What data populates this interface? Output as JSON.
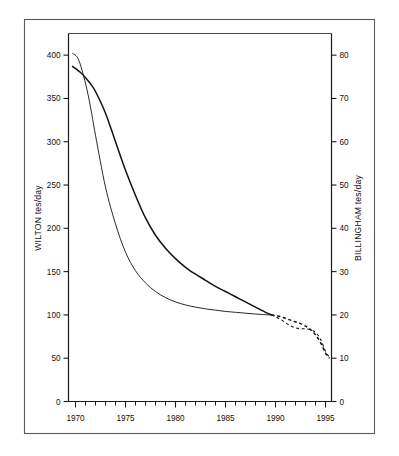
{
  "figure": {
    "background": "#ffffff",
    "ink": "#111111",
    "border_color": "#5a5a5a"
  },
  "chart_data": {
    "type": "line",
    "title": "",
    "xlabel": "",
    "ylabel": "WILTON  tes/day",
    "y2label": "BILLINGHAM  tes/day",
    "grid": false,
    "legend": "none",
    "xlim": [
      1969.3,
      1995.6
    ],
    "ylim": [
      0,
      425
    ],
    "y2lim": [
      0,
      85
    ],
    "x_ticks_major": [
      1970,
      1975,
      1980,
      1985,
      1990,
      1995
    ],
    "x_ticklabels": [
      "1970",
      "1975",
      "1980",
      "1985",
      "1990",
      "1995"
    ],
    "x_minor_step": 1,
    "y_ticks": [
      0,
      50,
      100,
      150,
      200,
      250,
      300,
      350,
      400
    ],
    "y_ticklabels": [
      "0",
      "50",
      "100",
      "150",
      "200",
      "250",
      "300",
      "350",
      "400"
    ],
    "y2_ticks": [
      0,
      10,
      20,
      30,
      40,
      50,
      60,
      70,
      80
    ],
    "y2_ticklabels": [
      "0",
      "10",
      "20",
      "30",
      "40",
      "50",
      "60",
      "70",
      "80"
    ],
    "series": [
      {
        "name": "WILTON",
        "axis": "left",
        "style": "solid",
        "linewidth": "bold",
        "x": [
          1969.7,
          1970.5,
          1971.0,
          1971.5,
          1972.0,
          1973.0,
          1974.0,
          1975.0,
          1976.0,
          1977.0,
          1978.0,
          1979.0,
          1980.0,
          1981.0,
          1982.0,
          1983.0,
          1984.0,
          1985.0,
          1986.0,
          1987.0,
          1988.0,
          1989.0,
          1989.6
        ],
        "values": [
          387,
          380,
          374,
          367,
          358,
          333,
          300,
          267,
          238,
          212,
          192,
          177,
          165,
          155,
          147,
          140,
          133,
          127,
          121,
          115,
          109,
          103,
          100
        ]
      },
      {
        "name": "WILTON-projected",
        "axis": "left",
        "style": "dashed",
        "linewidth": "bold",
        "x": [
          1989.6,
          1990.0,
          1990.5,
          1991.0,
          1991.5,
          1992.0,
          1992.5,
          1993.0,
          1993.5,
          1994.0,
          1994.5,
          1995.0,
          1995.4
        ],
        "values": [
          100,
          99,
          98,
          96,
          94,
          92,
          90,
          87,
          83,
          77,
          68,
          56,
          50
        ]
      },
      {
        "name": "BILLINGHAM",
        "axis": "right",
        "style": "solid",
        "linewidth": "thin",
        "x": [
          1969.7,
          1970.3,
          1971.0,
          1971.5,
          1972.0,
          1973.0,
          1974.0,
          1975.0,
          1976.0,
          1977.0,
          1978.0,
          1979.0,
          1980.0,
          1981.0,
          1982.0,
          1983.0,
          1984.0,
          1985.0,
          1986.0,
          1987.0,
          1988.0,
          1989.0,
          1989.6
        ],
        "values": [
          80.4,
          79.0,
          73.5,
          68.0,
          61.5,
          49.5,
          41.0,
          34.5,
          30.2,
          27.4,
          25.4,
          24.0,
          23.0,
          22.3,
          21.8,
          21.4,
          21.1,
          20.8,
          20.6,
          20.4,
          20.2,
          20.05,
          20.0
        ]
      },
      {
        "name": "BILLINGHAM-projected",
        "axis": "right",
        "style": "dashed",
        "linewidth": "thin",
        "x": [
          1989.6,
          1990.0,
          1990.5,
          1991.0,
          1991.5,
          1992.0,
          1992.5,
          1993.0,
          1993.5,
          1994.0,
          1994.5,
          1995.0,
          1995.4
        ],
        "values": [
          20.0,
          19.6,
          19.0,
          18.2,
          17.5,
          17.0,
          16.8,
          16.8,
          16.6,
          16.0,
          14.4,
          11.6,
          10.2
        ]
      }
    ]
  }
}
